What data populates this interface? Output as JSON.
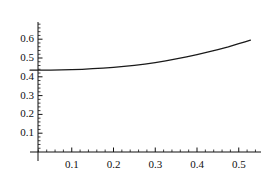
{
  "chart_data": {
    "type": "line",
    "title": "",
    "xlabel": "",
    "ylabel": "",
    "xlim": [
      -0.012,
      0.552
    ],
    "ylim": [
      0.0,
      0.69
    ],
    "grid": false,
    "legend": null,
    "axis_color": "#111111",
    "line_color": "#1a1a1a",
    "x_ticks": [
      0.1,
      0.2,
      0.3,
      0.4,
      0.5
    ],
    "x_tick_labels": [
      "0.1",
      "0.2",
      "0.3",
      "0.4",
      "0.5"
    ],
    "y_ticks": [
      0.1,
      0.2,
      0.3,
      0.4,
      0.5,
      0.6
    ],
    "y_tick_labels": [
      "0.1",
      "0.2",
      "0.3",
      "0.4",
      "0.5",
      "0.6"
    ],
    "x_minor_step": 0.02,
    "y_minor_step": 0.02,
    "series": [
      {
        "name": "curve",
        "x": [
          0.0,
          0.025,
          0.05,
          0.075,
          0.1,
          0.125,
          0.15,
          0.175,
          0.2,
          0.225,
          0.25,
          0.275,
          0.3,
          0.325,
          0.35,
          0.375,
          0.4,
          0.425,
          0.45,
          0.475,
          0.5,
          0.515,
          0.528
        ],
        "y": [
          0.435,
          0.435,
          0.436,
          0.437,
          0.438,
          0.44,
          0.443,
          0.446,
          0.45,
          0.455,
          0.461,
          0.468,
          0.476,
          0.485,
          0.495,
          0.506,
          0.518,
          0.531,
          0.545,
          0.559,
          0.576,
          0.586,
          0.595
        ]
      }
    ]
  },
  "axes": {
    "y_axis_name": "y-axis",
    "x_axis_name": "x-axis"
  }
}
